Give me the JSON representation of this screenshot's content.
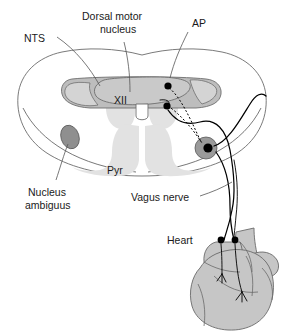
{
  "figure": {
    "labels": {
      "nts": "NTS",
      "dorsal_motor_nucleus": "Dorsal motor",
      "dorsal_motor_nucleus_line2": "nucleus",
      "ap": "AP",
      "hypoglossal": "XII",
      "pyramid": "Pyr",
      "nucleus_ambiguus": "Nucleus",
      "nucleus_ambiguus_line2": "ambiguus",
      "vagus_nerve": "Vagus nerve",
      "heart": "Heart"
    },
    "colors": {
      "background": "#ffffff",
      "outline_stroke": "#6b6b6b",
      "tract_fill": "#e2e2e2",
      "nts_fill": "#bdbdbd",
      "dmn_fill": "#c9c9c9",
      "area_postrema_fill": "#d4d4d4",
      "nucleus_ambiguus_fill": "#8f8f8f",
      "ganglion_fill": "#9a9a9a",
      "heart_fill": "#c6c6c6",
      "nerve_stroke": "#000000",
      "text": "#1a1a1a"
    },
    "structures": [
      {
        "name": "medulla-outline",
        "kind": "section-boundary"
      },
      {
        "name": "nts",
        "kind": "nucleus",
        "label": "NTS"
      },
      {
        "name": "dorsal-motor-nucleus",
        "kind": "nucleus",
        "label": "Dorsal motor nucleus"
      },
      {
        "name": "area-postrema",
        "kind": "circumventricular-organ",
        "label": "AP"
      },
      {
        "name": "hypoglossal-nucleus",
        "kind": "nucleus",
        "label": "XII"
      },
      {
        "name": "pyramid",
        "kind": "tract",
        "label": "Pyr"
      },
      {
        "name": "nucleus-ambiguus",
        "kind": "nucleus",
        "label": "Nucleus ambiguus"
      },
      {
        "name": "nodose-ganglion",
        "kind": "ganglion"
      },
      {
        "name": "vagus-nerve",
        "kind": "nerve",
        "label": "Vagus nerve"
      },
      {
        "name": "heart",
        "kind": "organ",
        "label": "Heart"
      }
    ],
    "neurons": {
      "preganglionic_somata": 2,
      "nodose_ganglion_somata": 1,
      "intracardiac_ganglia": 2
    }
  }
}
